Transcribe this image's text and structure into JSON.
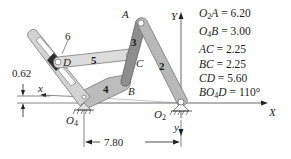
{
  "diagram": {
    "links": [
      {
        "id": "2",
        "label": "2",
        "from": "O2",
        "to": "A"
      },
      {
        "id": "3",
        "label": "3",
        "from": "A",
        "to": "B"
      },
      {
        "id": "4",
        "label": "4",
        "from": "O4",
        "to": "B"
      },
      {
        "id": "5",
        "label": "5",
        "from": "C",
        "to": "D"
      },
      {
        "id": "6",
        "label": "6",
        "type": "slider block"
      }
    ],
    "points": {
      "A": "A",
      "B": "B",
      "C": "C",
      "D": "D",
      "O2_main": "O",
      "O2_sub": "2",
      "O4_main": "O",
      "O4_sub": "4"
    },
    "axes": {
      "X": "X",
      "Y": "Y",
      "x_local": "x",
      "y_local": "y"
    },
    "dimensions": {
      "horizontal_distance": "7.80",
      "vertical_offset": "0.62"
    },
    "parameters": [
      {
        "name_main": "O",
        "name_sub": "2",
        "name_rest": "A",
        "value": "6.20"
      },
      {
        "name_main": "O",
        "name_sub": "4",
        "name_rest": "B",
        "value": "3.00"
      },
      {
        "name_main": "AC",
        "name_sub": "",
        "name_rest": "",
        "value": "2.25"
      },
      {
        "name_main": "BC",
        "name_sub": "",
        "name_rest": "",
        "value": "2.25"
      },
      {
        "name_main": "CD",
        "name_sub": "",
        "name_rest": "",
        "value": "5.60"
      },
      {
        "name_main": "BO",
        "name_sub": "4",
        "name_rest": "D",
        "value": "110°"
      }
    ],
    "colors": {
      "link_light": "#d6d6d6",
      "link_mid": "#b8b8b8",
      "link_dark": "#8a8a8a",
      "link_outline": "#6a6a6a",
      "slider_block": "#2e2e2e",
      "line": "#444444"
    }
  }
}
